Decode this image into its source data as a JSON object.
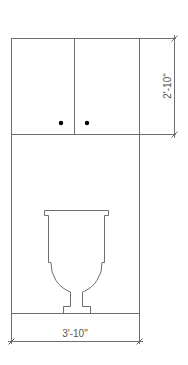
{
  "drawing": {
    "title": "Toilet elevation with upper cabinet",
    "line_color": "#6e6e6e",
    "knob_color": "#000000",
    "dimensions": {
      "cabinet_height": "2'-10\"",
      "overall_width": "3'-10\""
    },
    "elements": {
      "upper_cabinet": {
        "doors": 2,
        "knobs": 2
      },
      "fixture": "toilet"
    }
  }
}
